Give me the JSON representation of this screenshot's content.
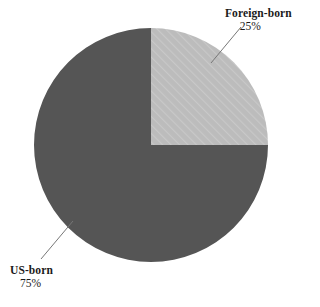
{
  "chart_data": {
    "type": "pie",
    "title": "",
    "categories": [
      "Foreign-born",
      "US-born"
    ],
    "values": [
      25,
      75
    ],
    "value_unit": "%",
    "labels": [
      "25%",
      "75%"
    ],
    "legend": "none",
    "annotations": [
      {
        "text": "Foreign-born",
        "value": "25%",
        "position": "top-right",
        "leader_line": true
      },
      {
        "text": "US-born",
        "value": "75%",
        "position": "bottom-left",
        "leader_line": true
      }
    ],
    "slices": [
      {
        "name": "Foreign-born",
        "value": 25,
        "label": "25%",
        "color": "#b9b9b9",
        "pattern": "diagonal-hatch",
        "start_angle_deg": 0,
        "end_angle_deg": 90
      },
      {
        "name": "US-born",
        "value": 75,
        "label": "75%",
        "color": "#555555",
        "pattern": "solid",
        "start_angle_deg": 90,
        "end_angle_deg": 360
      }
    ],
    "geometry": {
      "center_x": 151,
      "center_y": 145,
      "radius": 117,
      "start_angle": "12 o'clock",
      "direction": "clockwise"
    }
  },
  "colors": {
    "background": "#ffffff",
    "dark_slice": "#555555",
    "light_slice": "#b9b9b9",
    "hatch": "#c9c9c9",
    "text": "#1a1a1a",
    "leader_line": "#777777"
  },
  "foreign_callout": {
    "name": "Foreign-born",
    "value": "25%"
  },
  "us_callout": {
    "name": "US-born",
    "value": "75%"
  }
}
